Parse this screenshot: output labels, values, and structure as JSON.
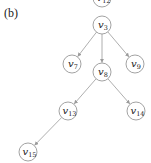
{
  "figure": {
    "panel_label": "(b)",
    "nodes": [
      {
        "id": "v12",
        "base": "v",
        "sub": "12",
        "x": 102,
        "y": -2
      },
      {
        "id": "v3",
        "base": "v",
        "sub": "3",
        "x": 102,
        "y": 25
      },
      {
        "id": "v7",
        "base": "v",
        "sub": "7",
        "x": 72,
        "y": 64
      },
      {
        "id": "v8",
        "base": "v",
        "sub": "8",
        "x": 102,
        "y": 72
      },
      {
        "id": "v9",
        "base": "v",
        "sub": "9",
        "x": 135,
        "y": 64
      },
      {
        "id": "v13",
        "base": "v",
        "sub": "13",
        "x": 68,
        "y": 111
      },
      {
        "id": "v14",
        "base": "v",
        "sub": "14",
        "x": 136,
        "y": 111
      },
      {
        "id": "v15",
        "base": "v",
        "sub": "15",
        "x": 28,
        "y": 152
      }
    ],
    "edges": [
      {
        "from": "v3",
        "to": "v7"
      },
      {
        "from": "v3",
        "to": "v8"
      },
      {
        "from": "v3",
        "to": "v9"
      },
      {
        "from": "v8",
        "to": "v13"
      },
      {
        "from": "v8",
        "to": "v14"
      },
      {
        "from": "v13",
        "to": "v15"
      }
    ],
    "node_radius": 9
  }
}
